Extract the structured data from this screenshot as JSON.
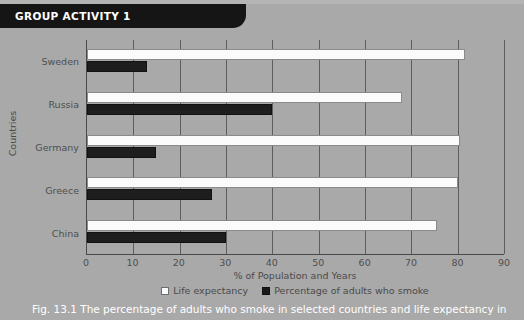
{
  "banner": {
    "label": "GROUP ACTIVITY 1"
  },
  "caption": {
    "text": "Fig. 13.1 The percentage of adults who smoke in selected countries and life expectancy in"
  },
  "colors": {
    "page_background": "#a9a9a9",
    "banner_background": "#151515",
    "life_expectancy_bar": "#fbfbfb",
    "smoking_bar": "#1e1e1e",
    "gridline": "#5d5d5d",
    "axis": "#4a4a4a",
    "caption_text": "#ffffff"
  },
  "legend": {
    "items": [
      {
        "label": "Life expectancy",
        "swatch": "white-square-icon"
      },
      {
        "label": "Percentage of adults who smoke",
        "swatch": "black-square-icon"
      }
    ]
  },
  "chart_data": {
    "type": "bar",
    "orientation": "horizontal",
    "title": "",
    "xlabel": "% of Population and Years",
    "ylabel": "Countries",
    "categories": [
      "Sweden",
      "Russia",
      "Germany",
      "Greece",
      "China"
    ],
    "xlim": [
      0,
      90
    ],
    "xticks": [
      0,
      10,
      20,
      30,
      40,
      50,
      60,
      70,
      80,
      90
    ],
    "xtick_labels": [
      "0",
      "10",
      "20",
      "30",
      "40",
      "50",
      "60",
      "70",
      "80",
      "90"
    ],
    "grid": true,
    "grid_axis": "x",
    "legend_position": "bottom",
    "series": [
      {
        "name": "Life expectancy",
        "color": "#fbfbfb",
        "values": [
          81.5,
          68,
          80.5,
          80,
          75.5
        ]
      },
      {
        "name": "Percentage of adults who smoke",
        "color": "#1e1e1e",
        "values": [
          13,
          40,
          15,
          27,
          30
        ]
      }
    ]
  }
}
